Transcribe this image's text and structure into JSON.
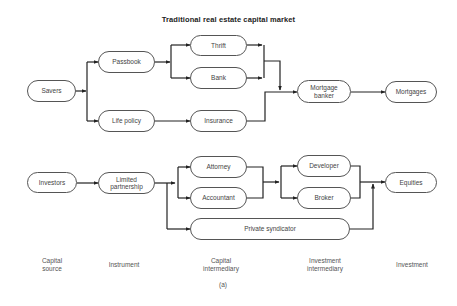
{
  "title": "Traditional real estate capital market",
  "nodes": {
    "savers": "Savers",
    "passbook": "Passbook",
    "life_policy": "Life policy",
    "thrift": "Thrift",
    "bank": "Bank",
    "insurance": "Insurance",
    "mortgage_banker": "Mortgage\nbanker",
    "mortgages": "Mortgages",
    "investors": "Investors",
    "limited_partnership": "Limited\npartnership",
    "attorney": "Attorney",
    "accountant": "Accountant",
    "private_syndicator": "Private syndicator",
    "developer": "Developer",
    "broker": "Broker",
    "equities": "Equities"
  },
  "columns": [
    "Capital\nsource",
    "Instrument",
    "Capital\nintermediary",
    "Investment\nintermediary",
    "Investment"
  ],
  "caption": "(a)",
  "colors": {
    "line": "#222222",
    "border": "#555555",
    "text": "#444444"
  }
}
